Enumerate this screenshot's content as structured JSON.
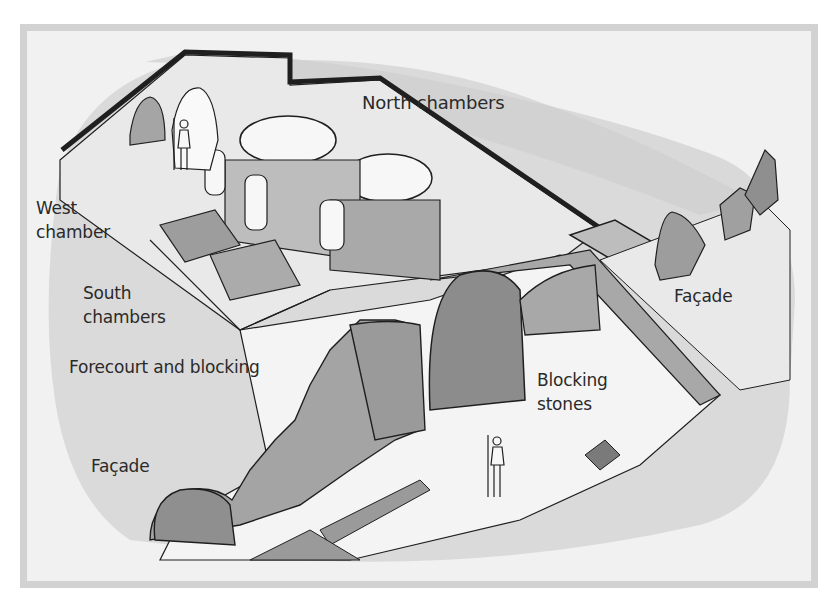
{
  "figure": {
    "type": "cutaway illustration of a chambered tomb",
    "colors": {
      "background": "#ffffff",
      "frame_border": "#d2d2d2",
      "frame_fill": "#f1f1f1",
      "mound_fill": "#d9d9d9",
      "floor_fill": "#ececec",
      "ink": "#1f1f1f",
      "stone_fill": "#bdbdbd",
      "stone_light": "#f7f7f7"
    }
  },
  "labels": {
    "north_chambers": "North chambers",
    "west_chamber_line1": "West",
    "west_chamber_line2": "chamber",
    "south_chambers_line1": "South",
    "south_chambers_line2": "chambers",
    "forecourt": "Forecourt and blocking",
    "facade_left": "Façade",
    "facade_right": "Façade",
    "blocking_stones_line1": "Blocking",
    "blocking_stones_line2": "stones"
  }
}
